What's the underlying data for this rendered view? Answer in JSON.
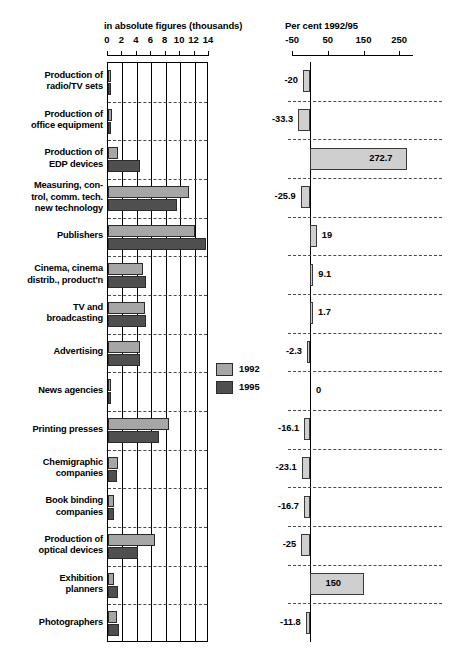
{
  "left_panel": {
    "title": "in absolute figures (thousands)",
    "tick_labels": [
      "0",
      "2",
      "4",
      "6",
      "8",
      "10",
      "12",
      "14"
    ]
  },
  "right_panel": {
    "title": "Per cent 1992/95",
    "tick_labels": [
      "-50",
      "50",
      "150",
      "250"
    ]
  },
  "legend": {
    "items": [
      {
        "label": "1992",
        "color": "#a6a6a6"
      },
      {
        "label": "1995",
        "color": "#4f4f4f"
      }
    ]
  },
  "chart_data": {
    "type": "bar",
    "orientation": "horizontal",
    "panels": [
      {
        "name": "absolute",
        "title": "in absolute figures (thousands)",
        "xlabel": "thousands",
        "xlim": [
          0,
          14
        ],
        "ticks": [
          0,
          2,
          4,
          6,
          8,
          10,
          12,
          14
        ],
        "grid": true,
        "series": [
          {
            "name": "1992",
            "color": "#a6a6a6",
            "values": [
              0.45,
              0.55,
              1.4,
              11.2,
              12.0,
              4.9,
              5.1,
              4.5,
              0.2,
              8.4,
              1.4,
              0.8,
              6.5,
              0.8,
              1.3
            ]
          },
          {
            "name": "1995",
            "color": "#4f4f4f",
            "values": [
              0.35,
              0.4,
              4.4,
              9.5,
              13.6,
              5.2,
              5.2,
              4.4,
              0.2,
              7.1,
              1.3,
              0.9,
              4.2,
              1.4,
              1.5
            ]
          }
        ]
      },
      {
        "name": "percent",
        "title": "Per cent 1992/95",
        "xlabel": "per cent",
        "xlim": [
          -50,
          290
        ],
        "ticks": [
          -50,
          50,
          150,
          250
        ],
        "grid": false,
        "values": [
          -20,
          -33.3,
          272.7,
          -25.9,
          19,
          9.1,
          1.7,
          -2.3,
          0,
          -16.1,
          -23.1,
          -16.7,
          -25,
          150,
          -11.8
        ],
        "value_labels": [
          "-20",
          "-33.3",
          "272.7",
          "-25.9",
          "19",
          "9.1",
          "1.7",
          "-2.3",
          "0",
          "-16.1",
          "-23.1",
          "-16.7",
          "-25",
          "150",
          "-11.8"
        ]
      }
    ],
    "categories": [
      "Production of radio/TV sets",
      "Production of office equipment",
      "Production of EDP devices",
      "Measuring, control, comm. tech. new technology",
      "Publishers",
      "Cinema, cinema distrib., product'n",
      "TV and broadcasting",
      "Advertising",
      "News agencies",
      "Printing presses",
      "Chemigraphic companies",
      "Book binding companies",
      "Production of optical devices",
      "Exhibition planners",
      "Photographers"
    ]
  },
  "rows": [
    {
      "label_lines": [
        "Production of",
        "radio/TV sets"
      ],
      "v1992": 0.45,
      "v1995": 0.35,
      "pct": -20,
      "pct_label": "-20"
    },
    {
      "label_lines": [
        "Production of",
        "office equipment"
      ],
      "v1992": 0.55,
      "v1995": 0.4,
      "pct": -33.3,
      "pct_label": "-33.3"
    },
    {
      "label_lines": [
        "Production of",
        "EDP devices"
      ],
      "v1992": 1.4,
      "v1995": 4.4,
      "pct": 272.7,
      "pct_label": "272.7"
    },
    {
      "label_lines": [
        "Measuring, con-",
        "trol, comm. tech.",
        "new technology"
      ],
      "v1992": 11.2,
      "v1995": 9.5,
      "pct": -25.9,
      "pct_label": "-25.9"
    },
    {
      "label_lines": [
        "Publishers"
      ],
      "v1992": 12.0,
      "v1995": 13.6,
      "pct": 19,
      "pct_label": "19"
    },
    {
      "label_lines": [
        "Cinema, cinema",
        "distrib., product'n"
      ],
      "v1992": 4.9,
      "v1995": 5.2,
      "pct": 9.1,
      "pct_label": "9.1"
    },
    {
      "label_lines": [
        "TV and",
        "broadcasting"
      ],
      "v1992": 5.1,
      "v1995": 5.2,
      "pct": 1.7,
      "pct_label": "1.7"
    },
    {
      "label_lines": [
        "Advertising"
      ],
      "v1992": 4.5,
      "v1995": 4.4,
      "pct": -2.3,
      "pct_label": "-2.3"
    },
    {
      "label_lines": [
        "News agencies"
      ],
      "v1992": 0.2,
      "v1995": 0.2,
      "pct": 0,
      "pct_label": "0"
    },
    {
      "label_lines": [
        "Printing presses"
      ],
      "v1992": 8.4,
      "v1995": 7.1,
      "pct": -16.1,
      "pct_label": "-16.1"
    },
    {
      "label_lines": [
        "Chemigraphic",
        "companies"
      ],
      "v1992": 1.4,
      "v1995": 1.3,
      "pct": -23.1,
      "pct_label": "-23.1"
    },
    {
      "label_lines": [
        "Book binding",
        "companies"
      ],
      "v1992": 0.8,
      "v1995": 0.9,
      "pct": -16.7,
      "pct_label": "-16.7"
    },
    {
      "label_lines": [
        "Production of",
        "optical devices"
      ],
      "v1992": 6.5,
      "v1995": 4.2,
      "pct": -25,
      "pct_label": "-25"
    },
    {
      "label_lines": [
        "Exhibition",
        "planners"
      ],
      "v1992": 0.8,
      "v1995": 1.4,
      "pct": 150,
      "pct_label": "150"
    },
    {
      "label_lines": [
        "Photographers"
      ],
      "v1992": 1.3,
      "v1995": 1.5,
      "pct": -11.8,
      "pct_label": "-11.8"
    }
  ]
}
